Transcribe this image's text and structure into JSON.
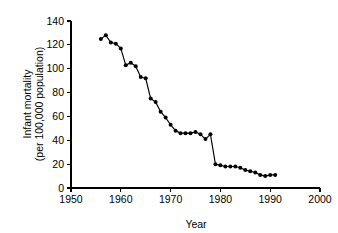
{
  "chart_data": {
    "type": "line",
    "title": "",
    "subtitle": "",
    "xlabel": "Year",
    "ylabel": "Infant mortality (per 100,000 population)",
    "ylabel_line1": "Infant mortality",
    "ylabel_line2": "(per 100,000 population)",
    "xlim": [
      1950,
      2000
    ],
    "ylim": [
      0,
      140
    ],
    "xticks": [
      1950,
      1960,
      1970,
      1980,
      1990,
      2000
    ],
    "xtick_labels": [
      "1950",
      "1960",
      "1970",
      "1980",
      "1990",
      "2000"
    ],
    "yticks": [
      0,
      20,
      40,
      60,
      80,
      100,
      120,
      140
    ],
    "ytick_labels": [
      "0",
      "20",
      "40",
      "60",
      "80",
      "100",
      "120",
      "140"
    ],
    "grid": false,
    "legend": false,
    "legend_position": "none",
    "marker": "filled-circle",
    "line_color": "#000000",
    "marker_color": "#000000",
    "background_color": "#ffffff",
    "x": [
      1956,
      1957,
      1958,
      1959,
      1960,
      1961,
      1962,
      1963,
      1964,
      1965,
      1966,
      1967,
      1968,
      1969,
      1970,
      1971,
      1972,
      1973,
      1974,
      1975,
      1976,
      1977,
      1978,
      1979,
      1980,
      1981,
      1982,
      1983,
      1984,
      1985,
      1986,
      1987,
      1988,
      1989,
      1990,
      1991
    ],
    "values": [
      125,
      128,
      122,
      121,
      117,
      103,
      105,
      102,
      93,
      92,
      75,
      72,
      64,
      59,
      53,
      48,
      46,
      46,
      46,
      47,
      45,
      41,
      45,
      20,
      19,
      18,
      18,
      18,
      17,
      15,
      14,
      13,
      11,
      10,
      11,
      11
    ],
    "series": [
      {
        "name": "Infant mortality",
        "x": [
          1956,
          1957,
          1958,
          1959,
          1960,
          1961,
          1962,
          1963,
          1964,
          1965,
          1966,
          1967,
          1968,
          1969,
          1970,
          1971,
          1972,
          1973,
          1974,
          1975,
          1976,
          1977,
          1978,
          1979,
          1980,
          1981,
          1982,
          1983,
          1984,
          1985,
          1986,
          1987,
          1988,
          1989,
          1990,
          1991
        ],
        "values": [
          125,
          128,
          122,
          121,
          117,
          103,
          105,
          102,
          93,
          92,
          75,
          72,
          64,
          59,
          53,
          48,
          46,
          46,
          46,
          47,
          45,
          41,
          45,
          20,
          19,
          18,
          18,
          18,
          17,
          15,
          14,
          13,
          11,
          10,
          11,
          11
        ]
      }
    ]
  }
}
